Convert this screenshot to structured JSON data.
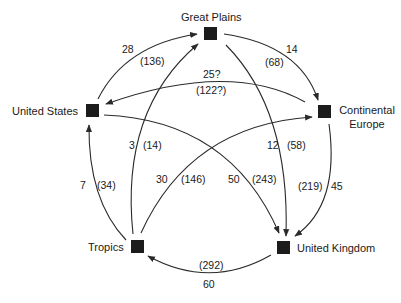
{
  "diagram": {
    "type": "flow-network",
    "nodes": [
      {
        "id": "great_plains",
        "label": "Great Plains",
        "x": 210,
        "y": 34
      },
      {
        "id": "united_states",
        "label": "United States",
        "x": 92,
        "y": 111
      },
      {
        "id": "continental_europe",
        "label": "Continental Europe",
        "label_line1": "Continental",
        "label_line2": "Europe",
        "x": 324,
        "y": 112
      },
      {
        "id": "tropics",
        "label": "Tropics",
        "x": 137,
        "y": 246
      },
      {
        "id": "united_kingdom",
        "label": "United Kingdom",
        "x": 283,
        "y": 247
      }
    ],
    "edges": [
      {
        "from": "united_states",
        "to": "great_plains",
        "value": "28",
        "value_paren": "(136)"
      },
      {
        "from": "great_plains",
        "to": "continental_europe",
        "value": "14",
        "value_paren": "(68)"
      },
      {
        "from": "continental_europe",
        "to": "united_states",
        "value": "25?",
        "value_paren": "(122?)"
      },
      {
        "from": "tropics",
        "to": "great_plains",
        "value": "3",
        "value_paren": "(14)"
      },
      {
        "from": "great_plains",
        "to": "united_kingdom",
        "value": "12",
        "value_paren": "(58)"
      },
      {
        "from": "tropics",
        "to": "united_states",
        "value": "7",
        "value_paren": "(34)"
      },
      {
        "from": "tropics",
        "to": "continental_europe",
        "value": "30",
        "value_paren": "(146)"
      },
      {
        "from": "united_states",
        "to": "united_kingdom",
        "value": "50",
        "value_paren": "(243)"
      },
      {
        "from": "continental_europe",
        "to": "united_kingdom",
        "value": "45",
        "value_paren": "(219)"
      },
      {
        "from": "united_kingdom",
        "to": "tropics",
        "value": "60",
        "value_paren": "(292)"
      }
    ],
    "colors": {
      "line": "#2a2a2a",
      "node": "#1c1c1c",
      "text": "#1a1a1a",
      "background": "#ffffff"
    }
  }
}
